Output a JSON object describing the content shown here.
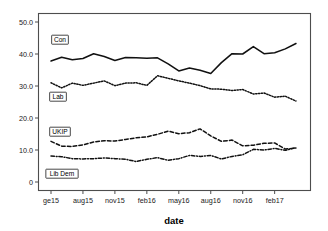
{
  "chart_data": {
    "type": "line",
    "title": "",
    "xlabel": "date",
    "ylabel": "",
    "ylim": [
      0,
      50
    ],
    "yticks": [
      "0",
      "10.0",
      "20.0",
      "30.0",
      "40.0",
      "50.0"
    ],
    "ytick_values": [
      0,
      10,
      20,
      30,
      40,
      50
    ],
    "grid": false,
    "legend_position": "inline-labels",
    "xticks": [
      "ge15",
      "aug15",
      "nov15",
      "feb16",
      "may16",
      "aug16",
      "nov16",
      "feb17"
    ],
    "xtick_values": [
      0,
      3,
      6,
      9,
      12,
      15,
      18,
      21
    ],
    "x": [
      0,
      1,
      2,
      3,
      4,
      5,
      6,
      7,
      8,
      9,
      10,
      11,
      12,
      13,
      14,
      15,
      16,
      17,
      18,
      19,
      20,
      21,
      22,
      23
    ],
    "series": [
      {
        "name": "Con",
        "style": "solid",
        "values": [
          37.8,
          39.0,
          38.2,
          38.6,
          40.1,
          39.2,
          38.0,
          38.9,
          38.8,
          38.7,
          38.8,
          36.9,
          34.7,
          35.6,
          34.9,
          33.9,
          37.3,
          40.1,
          40.0,
          42.3,
          40.1,
          40.4,
          41.6,
          43.3
        ]
      },
      {
        "name": "Lab",
        "style": "dotted",
        "values": [
          31.0,
          29.4,
          30.9,
          30.2,
          30.9,
          31.6,
          30.1,
          30.9,
          31.0,
          30.2,
          33.2,
          32.4,
          31.6,
          30.9,
          30.1,
          29.1,
          29.0,
          28.6,
          28.9,
          27.5,
          27.8,
          26.5,
          26.8,
          25.3
        ]
      },
      {
        "name": "UKIP",
        "style": "dashed",
        "values": [
          12.7,
          11.2,
          11.1,
          11.6,
          12.5,
          12.9,
          12.8,
          13.3,
          13.8,
          14.1,
          14.9,
          15.9,
          15.1,
          15.4,
          16.6,
          14.4,
          12.7,
          13.1,
          11.3,
          11.5,
          12.1,
          12.2,
          10.3,
          10.6
        ]
      },
      {
        "name": "Lib Dem",
        "style": "dashdot",
        "values": [
          8.1,
          7.9,
          7.3,
          7.2,
          7.3,
          7.5,
          7.3,
          7.1,
          6.4,
          7.1,
          7.6,
          6.8,
          7.3,
          8.3,
          8.0,
          8.3,
          7.2,
          8.0,
          8.5,
          10.2,
          10.0,
          10.5,
          9.9,
          10.7
        ]
      }
    ],
    "series_inline_labels": [
      {
        "name": "Con",
        "x_px": 60,
        "y_px": 42
      },
      {
        "name": "Lab",
        "x_px": 58,
        "y_px": 99
      },
      {
        "name": "UKIP",
        "x_px": 60,
        "y_px": 134
      },
      {
        "name": "Lib Dem",
        "x_px": 62,
        "y_px": 176
      }
    ]
  },
  "axis": {
    "x_title": "date"
  }
}
